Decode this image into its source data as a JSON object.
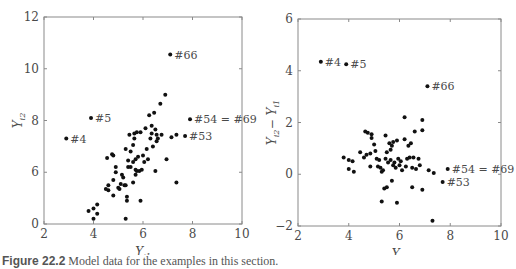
{
  "chart_data": [
    {
      "type": "scatter",
      "title": "",
      "xlabel": "Y_i1",
      "ylabel": "Y_i2",
      "xlim": [
        2,
        10
      ],
      "ylim": [
        4,
        12
      ],
      "xticks": [
        "2",
        "4",
        "6",
        "8",
        "10"
      ],
      "yticks": [
        "0",
        "6",
        "8",
        "10",
        "12"
      ],
      "ytick_values": [
        4,
        6,
        8,
        10,
        12
      ],
      "grid": false,
      "legend": null,
      "annotations": [
        {
          "label": "#4",
          "x": 2.9,
          "y": 7.3
        },
        {
          "label": "#5",
          "x": 3.9,
          "y": 8.1
        },
        {
          "label": "#66",
          "x": 7.1,
          "y": 10.55
        },
        {
          "label": "#54 = #69",
          "x": 7.9,
          "y": 8.05
        },
        {
          "label": "#53",
          "x": 7.7,
          "y": 7.4
        }
      ],
      "points": [
        [
          2.9,
          7.3
        ],
        [
          3.9,
          8.1
        ],
        [
          7.1,
          10.55
        ],
        [
          7.9,
          8.05
        ],
        [
          7.7,
          7.4
        ],
        [
          3.8,
          4.5
        ],
        [
          4.0,
          4.2
        ],
        [
          4.0,
          4.6
        ],
        [
          4.15,
          4.4
        ],
        [
          4.15,
          4.75
        ],
        [
          4.5,
          5.35
        ],
        [
          4.55,
          6.55
        ],
        [
          4.6,
          5.3
        ],
        [
          4.6,
          5.5
        ],
        [
          4.75,
          6.7
        ],
        [
          4.8,
          5.1
        ],
        [
          4.8,
          5.7
        ],
        [
          4.8,
          6.65
        ],
        [
          4.9,
          6.2
        ],
        [
          4.9,
          6.0
        ],
        [
          5.0,
          5.4
        ],
        [
          5.05,
          5.35
        ],
        [
          5.1,
          5.55
        ],
        [
          5.15,
          5.9
        ],
        [
          5.2,
          5.8
        ],
        [
          5.25,
          5.5
        ],
        [
          5.3,
          5.5
        ],
        [
          5.3,
          4.2
        ],
        [
          5.3,
          6.9
        ],
        [
          5.35,
          4.9
        ],
        [
          5.35,
          5.05
        ],
        [
          5.4,
          6.2
        ],
        [
          5.4,
          6.45
        ],
        [
          5.45,
          7.45
        ],
        [
          5.5,
          6.2
        ],
        [
          5.5,
          6.8
        ],
        [
          5.6,
          6.4
        ],
        [
          5.6,
          7.05
        ],
        [
          5.6,
          5.6
        ],
        [
          5.65,
          7.3
        ],
        [
          5.65,
          7.5
        ],
        [
          5.7,
          5.9
        ],
        [
          5.7,
          6.1
        ],
        [
          5.7,
          6.5
        ],
        [
          5.75,
          7.55
        ],
        [
          5.75,
          6.05
        ],
        [
          5.8,
          6.6
        ],
        [
          5.85,
          6.05
        ],
        [
          5.9,
          4.9
        ],
        [
          5.9,
          7.55
        ],
        [
          5.95,
          6.1
        ],
        [
          6.0,
          6.65
        ],
        [
          6.05,
          6.4
        ],
        [
          6.1,
          7.7
        ],
        [
          6.15,
          6.9
        ],
        [
          6.2,
          6.5
        ],
        [
          6.25,
          8.2
        ],
        [
          6.3,
          7.3
        ],
        [
          6.35,
          7.5
        ],
        [
          6.35,
          7.8
        ],
        [
          6.4,
          7.0
        ],
        [
          6.45,
          8.3
        ],
        [
          6.5,
          6.05
        ],
        [
          6.5,
          7.65
        ],
        [
          6.55,
          7.2
        ],
        [
          6.55,
          7.45
        ],
        [
          6.6,
          7.3
        ],
        [
          6.7,
          8.65
        ],
        [
          6.75,
          7.45
        ],
        [
          6.9,
          9.0
        ],
        [
          6.95,
          6.5
        ],
        [
          7.15,
          7.35
        ],
        [
          7.35,
          5.6
        ],
        [
          7.35,
          7.45
        ]
      ]
    },
    {
      "type": "scatter",
      "title": "",
      "xlabel": "Y_i1",
      "ylabel": "Y_i2 − Y_i1",
      "xlim": [
        2,
        10
      ],
      "ylim": [
        -2,
        6
      ],
      "xticks": [
        "2",
        "4",
        "6",
        "8",
        "10"
      ],
      "yticks": [
        "−2",
        "0",
        "2",
        "4",
        "6"
      ],
      "grid": false,
      "legend": null,
      "annotations": [
        {
          "label": "#4",
          "x": 2.9,
          "y": 4.35
        },
        {
          "label": "#5",
          "x": 3.9,
          "y": 4.25
        },
        {
          "label": "#66",
          "x": 7.1,
          "y": 3.4
        },
        {
          "label": "#54 = #69",
          "x": 7.9,
          "y": 0.2
        },
        {
          "label": "#53",
          "x": 7.7,
          "y": -0.3
        }
      ],
      "points": [
        [
          2.9,
          4.35
        ],
        [
          3.9,
          4.25
        ],
        [
          7.1,
          3.4
        ],
        [
          7.9,
          0.2
        ],
        [
          7.7,
          -0.3
        ],
        [
          3.8,
          0.65
        ],
        [
          4.0,
          0.55
        ],
        [
          4.0,
          0.2
        ],
        [
          4.15,
          0.5
        ],
        [
          4.2,
          0.1
        ],
        [
          4.45,
          0.85
        ],
        [
          4.6,
          0.65
        ],
        [
          4.65,
          1.65
        ],
        [
          4.7,
          0.75
        ],
        [
          4.75,
          1.6
        ],
        [
          4.85,
          0.3
        ],
        [
          4.85,
          0.8
        ],
        [
          4.9,
          1.55
        ],
        [
          4.9,
          1.4
        ],
        [
          5.0,
          1.15
        ],
        [
          5.05,
          0.9
        ],
        [
          5.1,
          0.6
        ],
        [
          5.15,
          0.3
        ],
        [
          5.2,
          0.55
        ],
        [
          5.25,
          0.25
        ],
        [
          5.3,
          0.1
        ],
        [
          5.3,
          -1.05
        ],
        [
          5.35,
          0.15
        ],
        [
          5.4,
          -0.55
        ],
        [
          5.45,
          0.6
        ],
        [
          5.45,
          1.5
        ],
        [
          5.5,
          0.85
        ],
        [
          5.5,
          -0.5
        ],
        [
          5.55,
          0.45
        ],
        [
          5.6,
          1.2
        ],
        [
          5.65,
          0.95
        ],
        [
          5.65,
          0.55
        ],
        [
          5.7,
          -0.25
        ],
        [
          5.7,
          1.1
        ],
        [
          5.75,
          1.25
        ],
        [
          5.75,
          0.35
        ],
        [
          5.8,
          0.45
        ],
        [
          5.85,
          0.25
        ],
        [
          5.9,
          1.3
        ],
        [
          5.9,
          -1.1
        ],
        [
          5.95,
          0.6
        ],
        [
          6.0,
          0.35
        ],
        [
          6.05,
          0.5
        ],
        [
          6.1,
          0.15
        ],
        [
          6.2,
          2.2
        ],
        [
          6.2,
          1.35
        ],
        [
          6.25,
          0.3
        ],
        [
          6.3,
          0.6
        ],
        [
          6.35,
          1.1
        ],
        [
          6.4,
          0.65
        ],
        [
          6.45,
          1.2
        ],
        [
          6.5,
          0.25
        ],
        [
          6.5,
          -0.5
        ],
        [
          6.55,
          0.65
        ],
        [
          6.6,
          1.65
        ],
        [
          6.65,
          0.2
        ],
        [
          6.75,
          0.6
        ],
        [
          6.8,
          0.35
        ],
        [
          6.9,
          2.1
        ],
        [
          6.9,
          1.7
        ],
        [
          6.9,
          -0.6
        ],
        [
          7.15,
          0.15
        ],
        [
          7.35,
          0.05
        ],
        [
          7.3,
          -1.8
        ]
      ]
    }
  ],
  "caption": {
    "label": "Figure 22.2",
    "text": "Model data for the examples in this section."
  }
}
